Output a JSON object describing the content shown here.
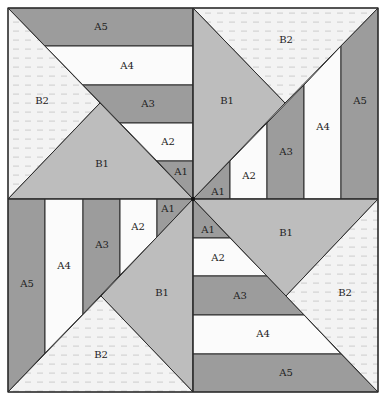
{
  "diagram": {
    "colors": {
      "dark": "#9c9c9c",
      "light": "#fbfbfb",
      "b1": "#bdbdbd",
      "b2": "#f3f3f3",
      "line": "#2a2a2a",
      "background": "#ffffff"
    },
    "quadrants": {
      "top_left": {
        "labels": {
          "A5": "A5",
          "A4": "A4",
          "A3": "A3",
          "A2": "A2",
          "A1": "A1",
          "B1": "B1",
          "B2": "B2"
        }
      },
      "top_right": {
        "labels": {
          "A5": "A5",
          "A4": "A4",
          "A3": "A3",
          "A2": "A2",
          "A1": "A1",
          "B1": "B1",
          "B2": "B2"
        }
      },
      "bottom_left": {
        "labels": {
          "A5": "A5",
          "A4": "A4",
          "A3": "A3",
          "A2": "A2",
          "A1": "A1",
          "B1": "B1",
          "B2": "B2"
        }
      },
      "bottom_right": {
        "labels": {
          "A5": "A5",
          "A4": "A4",
          "A3": "A3",
          "A2": "A2",
          "A1": "A1",
          "B1": "B1",
          "B2": "B2"
        }
      }
    }
  }
}
